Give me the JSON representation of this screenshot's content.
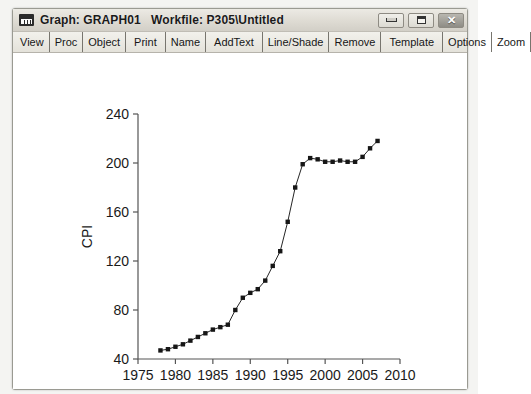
{
  "window": {
    "title": "Graph: GRAPH01   Workfile: P305\\Untitled",
    "icon": "graph-window-icon",
    "buttons": {
      "minimize": "minimize-icon",
      "maximize": "maximize-icon",
      "close": "✕"
    }
  },
  "toolbar": {
    "items": [
      {
        "label": "View"
      },
      {
        "label": "Proc"
      },
      {
        "label": "Object"
      },
      {
        "label": "Print"
      },
      {
        "label": "Name"
      },
      {
        "label": "AddText"
      },
      {
        "label": "Line/Shade"
      },
      {
        "label": "Remove"
      },
      {
        "label": "Template"
      },
      {
        "label": "Options"
      },
      {
        "label": "Zoom"
      }
    ]
  },
  "chart_data": {
    "type": "line",
    "title": "",
    "xlabel": "T",
    "ylabel": "CPI",
    "xlim": [
      1975,
      2010
    ],
    "ylim": [
      40,
      240
    ],
    "xticks": [
      1975,
      1980,
      1985,
      1990,
      1995,
      2000,
      2005,
      2010
    ],
    "yticks": [
      40,
      80,
      120,
      160,
      200,
      240
    ],
    "grid": false,
    "legend": "none",
    "markers": "filled-square",
    "series": [
      {
        "name": "CPI",
        "x": [
          1978,
          1979,
          1980,
          1981,
          1982,
          1983,
          1984,
          1985,
          1986,
          1987,
          1988,
          1989,
          1990,
          1991,
          1992,
          1993,
          1994,
          1995,
          1996,
          1997,
          1998,
          1999,
          2000,
          2001,
          2002,
          2003,
          2004,
          2005,
          2006,
          2007
        ],
        "values": [
          47,
          48,
          50,
          52,
          55,
          58,
          61,
          64,
          66,
          68,
          80,
          90,
          94,
          97,
          104,
          116,
          128,
          152,
          180,
          199,
          204,
          203,
          201,
          201,
          202,
          201,
          201,
          205,
          212,
          218
        ]
      }
    ]
  }
}
